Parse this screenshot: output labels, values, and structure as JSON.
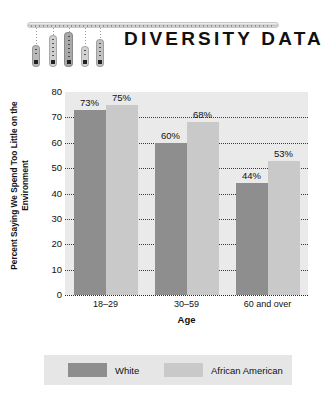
{
  "header": {
    "title": "DIVERSITY DATA",
    "ornament_icon": "hanging-bars-mobile-icon"
  },
  "chart_data": {
    "type": "bar",
    "title": "",
    "xlabel": "Age",
    "ylabel": "Percent Saying We Spend Too Little on the Environment",
    "categories": [
      "18–29",
      "30–59",
      "60 and over"
    ],
    "series": [
      {
        "name": "White",
        "color": "#8e8e8e",
        "values": [
          73,
          60,
          44
        ],
        "labels": [
          "73%",
          "60%",
          "44%"
        ]
      },
      {
        "name": "African American",
        "color": "#c9c9c9",
        "values": [
          75,
          68,
          53
        ],
        "labels": [
          "75%",
          "68%",
          "53%"
        ]
      }
    ],
    "ylim": [
      0,
      80
    ],
    "ytick_step": 10,
    "yticks": [
      "0",
      "10",
      "20",
      "30",
      "40",
      "50",
      "60",
      "70",
      "80"
    ],
    "grid": true,
    "grid_style": "dotted-horizontal",
    "legend_position": "bottom",
    "plot_background": "#eaeaea"
  },
  "legend": {
    "items": [
      {
        "label": "White",
        "color": "#8e8e8e"
      },
      {
        "label": "African American",
        "color": "#c9c9c9"
      }
    ]
  }
}
